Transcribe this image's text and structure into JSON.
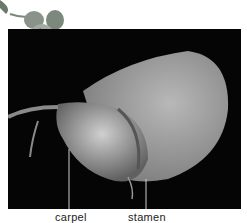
{
  "figure": {
    "labels": [
      {
        "id": "carpel",
        "text": "carpel"
      },
      {
        "id": "stamen",
        "text": "stamen"
      }
    ]
  }
}
